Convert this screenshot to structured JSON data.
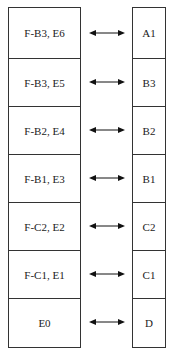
{
  "diagram": {
    "left_column": [
      "F-B3, E6",
      "F-B3, E5",
      "F-B2, E4",
      "F-B1, E3",
      "F-C2, E2",
      "F-C1, E1",
      "E0"
    ],
    "right_column": [
      "A1",
      "B3",
      "B2",
      "B1",
      "C2",
      "C1",
      "D"
    ],
    "connector": "bidirectional-arrow"
  }
}
